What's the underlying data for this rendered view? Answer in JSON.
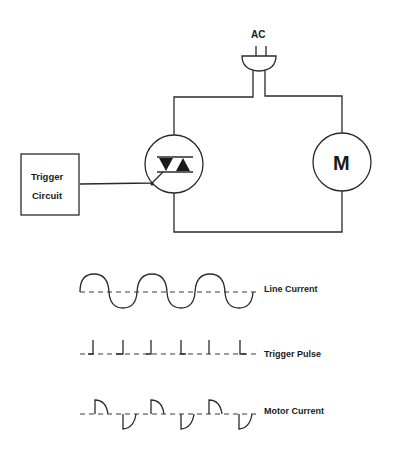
{
  "diagram": {
    "type": "triac motor control schematic with waveforms",
    "source": {
      "label": "AC",
      "icon": "ac-plug-icon"
    },
    "trigger_box": {
      "line1": "Trigger",
      "line2": "Circuit"
    },
    "triac": {
      "icon": "triac-icon"
    },
    "motor": {
      "label": "M"
    },
    "waveforms": [
      {
        "label": "Line Current",
        "kind": "sine"
      },
      {
        "label": "Trigger Pulse",
        "kind": "pulses"
      },
      {
        "label": "Motor Current",
        "kind": "chopped-sine"
      }
    ]
  },
  "colors": {
    "line": "#2a2a2a",
    "background": "#ffffff"
  }
}
